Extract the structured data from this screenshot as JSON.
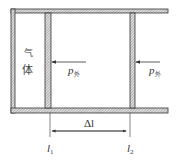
{
  "diagram": {
    "gas_label": [
      "气",
      "体"
    ],
    "pressure_labels": [
      {
        "base": "p",
        "sub": "外"
      },
      {
        "base": "p",
        "sub": "外"
      }
    ],
    "delta_label": "Δl",
    "positions": [
      {
        "base": "l",
        "sub": "1"
      },
      {
        "base": "l",
        "sub": "2"
      }
    ],
    "colors": {
      "line": "#333333",
      "hatch": "#8a8a8a",
      "background": "#ffffff"
    }
  }
}
